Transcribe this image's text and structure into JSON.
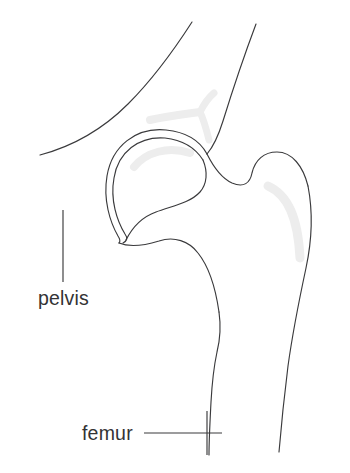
{
  "figure": {
    "background_color": "#ffffff",
    "outline_color": "#3a3a3c",
    "highlight_color": "#ededed",
    "label_color": "#333335"
  },
  "labels": {
    "pelvis": "pelvis",
    "femur": "femur"
  },
  "annotations": [
    {
      "name": "pelvis",
      "text": "pelvis",
      "leader_type": "vertical-tick",
      "text_x": 38,
      "text_y": 305,
      "leader_x1": 63,
      "leader_y1": 210,
      "leader_x2": 63,
      "leader_y2": 282
    },
    {
      "name": "femur",
      "text": "femur",
      "leader_type": "horizontal-with-tick",
      "text_x": 82,
      "text_y": 440,
      "leader_x1": 144,
      "leader_y1": 433,
      "leader_x2": 222,
      "leader_y2": 433,
      "tick_x": 207,
      "tick_y1": 411,
      "tick_y2": 455
    }
  ],
  "structures": [
    {
      "name": "pelvis-ilium",
      "description": "Upper pelvic blade with two diverging cortical lines"
    },
    {
      "name": "acetabulum",
      "description": "Double-line hip socket arc surrounding the femoral head"
    },
    {
      "name": "femoral-head",
      "description": "Rounded ball of the femur seated in the acetabulum"
    },
    {
      "name": "femoral-neck",
      "description": "Narrowed region between head and trochanter"
    },
    {
      "name": "greater-trochanter",
      "description": "Bony prominence lateral to the femoral neck"
    },
    {
      "name": "lesser-trochanter",
      "description": "Smaller medial bony prominence on the proximal femur"
    },
    {
      "name": "femoral-shaft",
      "description": "Long tapering diaphysis of the femur"
    }
  ]
}
